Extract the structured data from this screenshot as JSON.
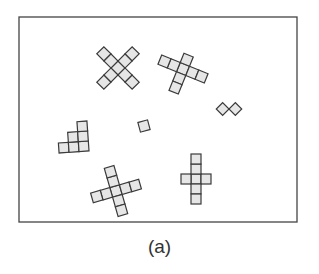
{
  "figure": {
    "caption": "(a)",
    "frame": {
      "x": 19,
      "y": 17,
      "width": 278,
      "height": 205,
      "stroke": "#444444"
    },
    "cell_size": 10,
    "colors": {
      "cell_fill": "#e6e6e6",
      "cell_stroke": "#3a3a3a",
      "background": "#ffffff"
    },
    "shapes": [
      {
        "name": "diagonal-x-pentomino-cross",
        "description": "X shape of 9 cells rotated 45 degrees",
        "center": [
          118,
          68
        ],
        "rotation": 45,
        "cells": [
          [
            0,
            0
          ],
          [
            -1,
            0
          ],
          [
            -2,
            0
          ],
          [
            1,
            0
          ],
          [
            2,
            0
          ],
          [
            0,
            -1
          ],
          [
            0,
            -2
          ],
          [
            0,
            1
          ],
          [
            0,
            2
          ]
        ]
      },
      {
        "name": "tilted-cross-top-right",
        "description": "Cross with 2-left, 2-right, 1-up, 2-down arms",
        "center": [
          183,
          69
        ],
        "rotation": 22,
        "cells": [
          [
            0,
            0
          ],
          [
            -1,
            0
          ],
          [
            -2,
            0
          ],
          [
            1,
            0
          ],
          [
            2,
            0
          ],
          [
            0,
            -1
          ],
          [
            0,
            1
          ],
          [
            0,
            2
          ]
        ]
      },
      {
        "name": "domino-diamonds",
        "description": "Two squares rotated 45 degrees touching at a vertex",
        "center": [
          229,
          109
        ],
        "rotation": 45,
        "cells": [
          [
            -0.5,
            0.5
          ],
          [
            0.5,
            -0.5
          ]
        ],
        "cell_size": 9
      },
      {
        "name": "single-square",
        "description": "Single tilted square",
        "center": [
          144,
          126
        ],
        "rotation": -15,
        "cells": [
          [
            0,
            0
          ]
        ]
      },
      {
        "name": "staircase",
        "description": "Staircase of 6 cells: 3 bottom, 2 middle, 1 top",
        "center": [
          73,
          137
        ],
        "rotation": -4,
        "cells": [
          [
            -1,
            1
          ],
          [
            0,
            1
          ],
          [
            1,
            1
          ],
          [
            0,
            0
          ],
          [
            1,
            0
          ],
          [
            1,
            -1
          ]
        ]
      },
      {
        "name": "tilted-cross-bottom-left",
        "description": "Cross with 2-unit arms in all directions",
        "center": [
          116,
          191
        ],
        "rotation": -16,
        "cells": [
          [
            0,
            0
          ],
          [
            -1,
            0
          ],
          [
            -2,
            0
          ],
          [
            1,
            0
          ],
          [
            2,
            0
          ],
          [
            0,
            -1
          ],
          [
            0,
            -2
          ],
          [
            0,
            1
          ],
          [
            0,
            2
          ]
        ]
      },
      {
        "name": "upright-cross-bottom-right",
        "description": "Upright cross: 2 up, 2 down, 1 left, 1 right",
        "center": [
          196,
          179
        ],
        "rotation": 0,
        "cells": [
          [
            0,
            0
          ],
          [
            -1,
            0
          ],
          [
            1,
            0
          ],
          [
            0,
            -1
          ],
          [
            0,
            -2
          ],
          [
            0,
            1
          ],
          [
            0,
            2
          ]
        ]
      }
    ]
  }
}
